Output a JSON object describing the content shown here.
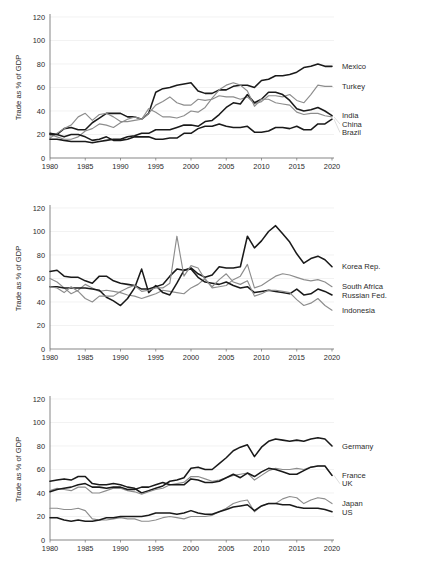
{
  "figure": {
    "panel_count": 3,
    "y_axis_title": "Trade as % of GDP",
    "y_ticks": [
      "0",
      "20",
      "40",
      "60",
      "80",
      "100",
      "120"
    ],
    "x_ticks": [
      "1980",
      "1985",
      "1990",
      "1995",
      "2000",
      "2005",
      "2010",
      "2015",
      "2020"
    ],
    "colors": {
      "dark": "#1a1a1a",
      "gray": "#8d8d8d",
      "grid": "#e9e9e9",
      "axis": "#6f6f6f"
    }
  },
  "chart_data": [
    {
      "type": "line",
      "title": "",
      "xlabel": "",
      "ylabel": "Trade as % of GDP",
      "xlim": [
        1980,
        2020
      ],
      "ylim": [
        0,
        120
      ],
      "yticks": [
        0,
        20,
        40,
        60,
        80,
        100,
        120
      ],
      "xticks": [
        1980,
        1985,
        1990,
        1995,
        2000,
        2005,
        2010,
        2015,
        2020
      ],
      "grid": true,
      "legend_position": "right-inline",
      "x": [
        1980,
        1981,
        1982,
        1983,
        1984,
        1985,
        1986,
        1987,
        1988,
        1989,
        1990,
        1991,
        1992,
        1993,
        1994,
        1995,
        1996,
        1997,
        1998,
        1999,
        2000,
        2001,
        2002,
        2003,
        2004,
        2005,
        2006,
        2007,
        2008,
        2009,
        2010,
        2011,
        2012,
        2013,
        2014,
        2015,
        2016,
        2017,
        2018,
        2019,
        2020
      ],
      "series": [
        {
          "name": "Mexico",
          "color": "#1a1a1a",
          "values": [
            21,
            20,
            25,
            26,
            24,
            24,
            30,
            34,
            38,
            38,
            38,
            35,
            35,
            33,
            38,
            56,
            59,
            60,
            62,
            63,
            64,
            57,
            55,
            55,
            58,
            58,
            61,
            62,
            62,
            60,
            66,
            67,
            70,
            70,
            71,
            73,
            77,
            78,
            80,
            78,
            78
          ]
        },
        {
          "name": "Turkey",
          "color": "#8d8d8d",
          "values": [
            17,
            21,
            25,
            28,
            35,
            38,
            32,
            37,
            38,
            35,
            31,
            31,
            32,
            33,
            38,
            45,
            48,
            52,
            47,
            45,
            45,
            50,
            49,
            50,
            53,
            52,
            52,
            50,
            52,
            46,
            48,
            53,
            53,
            52,
            54,
            49,
            47,
            54,
            62,
            61,
            61
          ]
        },
        {
          "name": "India",
          "color": "#1a1a1a",
          "values": [
            16,
            16,
            15,
            14,
            14,
            14,
            13,
            14,
            15,
            16,
            16,
            18,
            19,
            21,
            21,
            24,
            24,
            24,
            26,
            28,
            28,
            27,
            31,
            32,
            37,
            43,
            47,
            46,
            54,
            47,
            50,
            56,
            56,
            54,
            49,
            42,
            40,
            41,
            43,
            40,
            36
          ]
        },
        {
          "name": "China",
          "color": "#8d8d8d",
          "values": [
            20,
            18,
            16,
            16,
            18,
            23,
            25,
            29,
            28,
            26,
            30,
            33,
            35,
            33,
            42,
            39,
            35,
            35,
            34,
            36,
            40,
            39,
            43,
            51,
            58,
            62,
            64,
            62,
            57,
            44,
            50,
            50,
            47,
            46,
            45,
            39,
            37,
            38,
            38,
            36,
            35
          ]
        },
        {
          "name": "Brazil",
          "color": "#1a1a1a",
          "values": [
            20,
            20,
            18,
            20,
            20,
            18,
            15,
            16,
            18,
            15,
            15,
            16,
            18,
            18,
            18,
            16,
            16,
            17,
            17,
            21,
            21,
            25,
            27,
            27,
            29,
            27,
            26,
            26,
            27,
            22,
            22,
            23,
            26,
            26,
            25,
            27,
            24,
            24,
            29,
            29,
            33
          ]
        }
      ],
      "annotations": [
        "Mexico",
        "Turkey",
        "India",
        "China",
        "Brazil"
      ]
    },
    {
      "type": "line",
      "title": "",
      "xlabel": "",
      "ylabel": "Trade as % of GDP",
      "xlim": [
        1980,
        2020
      ],
      "ylim": [
        0,
        120
      ],
      "yticks": [
        0,
        20,
        40,
        60,
        80,
        100,
        120
      ],
      "xticks": [
        1980,
        1985,
        1990,
        1995,
        2000,
        2005,
        2010,
        2015,
        2020
      ],
      "grid": true,
      "legend_position": "right-inline",
      "x": [
        1980,
        1981,
        1982,
        1983,
        1984,
        1985,
        1986,
        1987,
        1988,
        1989,
        1990,
        1991,
        1992,
        1993,
        1994,
        1995,
        1996,
        1997,
        1998,
        1999,
        2000,
        2001,
        2002,
        2003,
        2004,
        2005,
        2006,
        2007,
        2008,
        2009,
        2010,
        2011,
        2012,
        2013,
        2014,
        2015,
        2016,
        2017,
        2018,
        2019,
        2020
      ],
      "series": [
        {
          "name": "Korea Rep.",
          "color": "#1a1a1a",
          "values": [
            66,
            67,
            62,
            61,
            61,
            58,
            56,
            62,
            62,
            58,
            56,
            55,
            54,
            51,
            51,
            53,
            55,
            62,
            68,
            67,
            69,
            64,
            61,
            63,
            70,
            69,
            69,
            70,
            96,
            86,
            92,
            100,
            105,
            98,
            91,
            81,
            73,
            77,
            79,
            76,
            70
          ]
        },
        {
          "name": "South Africa",
          "color": "#8d8d8d",
          "values": [
            60,
            57,
            52,
            47,
            50,
            55,
            52,
            49,
            50,
            49,
            48,
            46,
            45,
            43,
            45,
            47,
            50,
            49,
            48,
            47,
            52,
            55,
            60,
            52,
            53,
            54,
            59,
            62,
            72,
            52,
            54,
            58,
            62,
            64,
            63,
            61,
            59,
            58,
            59,
            57,
            53
          ]
        },
        {
          "name": "Russian Fed.",
          "color": "#1a1a1a",
          "values": [
            53,
            53,
            52,
            52,
            52,
            52,
            51,
            50,
            44,
            41,
            37,
            43,
            52,
            68,
            48,
            54,
            48,
            46,
            56,
            67,
            68,
            61,
            57,
            56,
            55,
            57,
            54,
            52,
            53,
            48,
            49,
            50,
            49,
            48,
            47,
            51,
            46,
            47,
            51,
            49,
            46
          ]
        },
        {
          "name": "Indonesia",
          "color": "#8d8d8d",
          "values": [
            53,
            52,
            48,
            53,
            49,
            43,
            40,
            45,
            45,
            45,
            49,
            52,
            54,
            49,
            50,
            52,
            52,
            56,
            96,
            62,
            71,
            69,
            59,
            53,
            59,
            64,
            57,
            55,
            58,
            45,
            47,
            50,
            50,
            49,
            48,
            42,
            37,
            39,
            43,
            37,
            33
          ]
        }
      ],
      "annotations": [
        "Korea Rep.",
        "South Africa",
        "Russian Fed.",
        "Indonesia"
      ]
    },
    {
      "type": "line",
      "title": "",
      "xlabel": "",
      "ylabel": "Trade as % of GDP",
      "xlim": [
        1980,
        2020
      ],
      "ylim": [
        0,
        120
      ],
      "yticks": [
        0,
        20,
        40,
        60,
        80,
        100,
        120
      ],
      "xticks": [
        1980,
        1985,
        1990,
        1995,
        2000,
        2005,
        2010,
        2015,
        2020
      ],
      "grid": true,
      "legend_position": "right-inline",
      "x": [
        1980,
        1981,
        1982,
        1983,
        1984,
        1985,
        1986,
        1987,
        1988,
        1989,
        1990,
        1991,
        1992,
        1993,
        1994,
        1995,
        1996,
        1997,
        1998,
        1999,
        2000,
        2001,
        2002,
        2003,
        2004,
        2005,
        2006,
        2007,
        2008,
        2009,
        2010,
        2011,
        2012,
        2013,
        2014,
        2015,
        2016,
        2017,
        2018,
        2019,
        2020
      ],
      "series": [
        {
          "name": "Germany",
          "color": "#1a1a1a",
          "values": [
            50,
            51,
            52,
            51,
            54,
            54,
            48,
            47,
            47,
            48,
            47,
            45,
            44,
            40,
            42,
            44,
            46,
            50,
            51,
            53,
            61,
            62,
            60,
            60,
            65,
            70,
            76,
            79,
            81,
            71,
            79,
            84,
            86,
            85,
            84,
            85,
            84,
            86,
            87,
            86,
            80
          ]
        },
        {
          "name": "France",
          "color": "#8d8d8d",
          "values": [
            42,
            44,
            43,
            42,
            45,
            45,
            40,
            40,
            42,
            44,
            44,
            42,
            41,
            39,
            41,
            43,
            44,
            47,
            48,
            49,
            54,
            54,
            52,
            50,
            51,
            53,
            55,
            56,
            57,
            51,
            55,
            59,
            61,
            60,
            60,
            61,
            60,
            62,
            63,
            63,
            55
          ]
        },
        {
          "name": "UK",
          "color": "#1a1a1a",
          "values": [
            41,
            43,
            44,
            45,
            47,
            48,
            45,
            45,
            44,
            45,
            45,
            43,
            43,
            45,
            45,
            47,
            49,
            47,
            47,
            47,
            52,
            51,
            49,
            49,
            50,
            53,
            56,
            53,
            57,
            54,
            58,
            61,
            60,
            58,
            56,
            56,
            59,
            62,
            63,
            63,
            55
          ]
        },
        {
          "name": "Japan",
          "color": "#8d8d8d",
          "values": [
            27,
            27,
            26,
            26,
            27,
            25,
            18,
            17,
            17,
            18,
            19,
            18,
            18,
            16,
            16,
            17,
            19,
            20,
            19,
            18,
            20,
            20,
            20,
            21,
            24,
            27,
            31,
            33,
            34,
            24,
            29,
            31,
            31,
            35,
            37,
            36,
            31,
            34,
            36,
            35,
            31
          ]
        },
        {
          "name": "US",
          "color": "#1a1a1a",
          "values": [
            19,
            19,
            17,
            16,
            17,
            16,
            16,
            17,
            19,
            19,
            20,
            20,
            20,
            20,
            21,
            23,
            23,
            23,
            22,
            23,
            25,
            23,
            22,
            22,
            24,
            26,
            28,
            29,
            30,
            25,
            29,
            31,
            31,
            30,
            30,
            28,
            27,
            27,
            27,
            26,
            24
          ]
        }
      ],
      "annotations": [
        "Germany",
        "France",
        "UK",
        "Japan",
        "US"
      ]
    }
  ]
}
